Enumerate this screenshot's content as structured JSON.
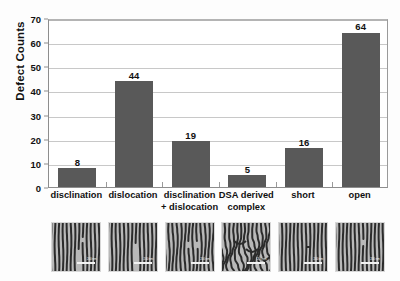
{
  "chart_data": {
    "type": "bar",
    "title": "",
    "xlabel": "",
    "ylabel": "Defect Counts",
    "categories": [
      "disclination",
      "dislocation",
      "disclination + dislocation",
      "DSA derived complex",
      "short",
      "open"
    ],
    "values": [
      8,
      44,
      19,
      5,
      16,
      64
    ],
    "ylim": [
      0,
      70
    ],
    "yticks": [
      0,
      10,
      20,
      30,
      40,
      50,
      60,
      70
    ],
    "ytick_labels": [
      "0",
      "10",
      "20",
      "30",
      "40",
      "50",
      "60",
      "70"
    ],
    "grid": true,
    "legend": "none",
    "bar_color": "#595959",
    "gridline_color": "#c8c8c8",
    "axis_color": "#8d8d8d",
    "plot_background": "#ffffff"
  },
  "axis": {
    "y_title": "Defect Counts"
  },
  "categories": [
    {
      "line1": "disclination",
      "line2": "",
      "value": "8"
    },
    {
      "line1": "dislocation",
      "line2": "",
      "value": "44"
    },
    {
      "line1": "disclination",
      "line2": "+ dislocation",
      "value": "19"
    },
    {
      "line1": "DSA derived",
      "line2": "complex",
      "value": "5"
    },
    {
      "line1": "short",
      "line2": "",
      "value": "16"
    },
    {
      "line1": "open",
      "line2": "",
      "value": "64"
    }
  ],
  "micrographs": [
    {
      "name": "micrograph-disclination",
      "scale_label": "200 nm"
    },
    {
      "name": "micrograph-dislocation",
      "scale_label": "200 nm"
    },
    {
      "name": "micrograph-disclination-dislocation",
      "scale_label": "200 nm"
    },
    {
      "name": "micrograph-dsa-derived-complex",
      "scale_label": "200 nm"
    },
    {
      "name": "micrograph-short",
      "scale_label": "200 nm"
    },
    {
      "name": "micrograph-open",
      "scale_label": "200 nm"
    }
  ]
}
